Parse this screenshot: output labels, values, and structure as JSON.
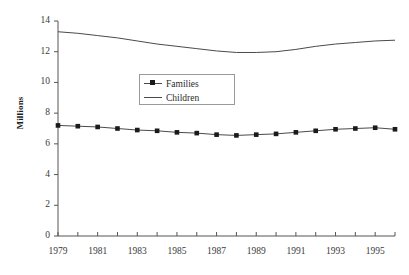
{
  "chart_data": {
    "type": "line",
    "title": "",
    "subtitle": "",
    "xlabel": "",
    "ylabel": "Millions",
    "xlim": [
      1979,
      1996
    ],
    "ylim": [
      0,
      14
    ],
    "grid": false,
    "legend_position": "inside-upper-left",
    "x": [
      1979,
      1980,
      1981,
      1982,
      1983,
      1984,
      1985,
      1986,
      1987,
      1988,
      1989,
      1990,
      1991,
      1992,
      1993,
      1994,
      1995,
      1996
    ],
    "xtick_labels": [
      "1979",
      "1981",
      "1983",
      "1985",
      "1987",
      "1989",
      "1991",
      "1993",
      "1995"
    ],
    "xtick_values": [
      1979,
      1981,
      1983,
      1985,
      1987,
      1989,
      1991,
      1993,
      1995
    ],
    "xminor_ticks": [
      1980,
      1982,
      1984,
      1986,
      1988,
      1990,
      1992,
      1994,
      1996
    ],
    "ytick_labels": [
      "0",
      "2",
      "4",
      "6",
      "8",
      "10",
      "12",
      "14"
    ],
    "ytick_values": [
      0,
      2,
      4,
      6,
      8,
      10,
      12,
      14
    ],
    "series": [
      {
        "name": "Families",
        "marker": "square",
        "color": "#4a4a4a",
        "marker_color": "#1a1a1a",
        "values": [
          7.2,
          7.15,
          7.1,
          7.0,
          6.9,
          6.85,
          6.75,
          6.7,
          6.6,
          6.55,
          6.6,
          6.65,
          6.75,
          6.85,
          6.95,
          7.0,
          7.05,
          6.95
        ]
      },
      {
        "name": "Children",
        "marker": "none",
        "color": "#4a4a4a",
        "marker_color": "#4a4a4a",
        "values": [
          13.3,
          13.2,
          13.05,
          12.9,
          12.7,
          12.5,
          12.35,
          12.2,
          12.05,
          11.95,
          11.95,
          12.0,
          12.15,
          12.35,
          12.5,
          12.6,
          12.7,
          12.75
        ]
      }
    ]
  },
  "axis": {
    "y_title": "Millions"
  }
}
